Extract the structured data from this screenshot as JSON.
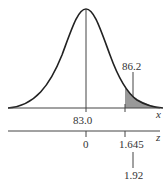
{
  "diagram": {
    "type": "normal-distribution",
    "mean_label": "83.0",
    "cutoff_label": "86.2",
    "x_axis_label": "x",
    "z_axis_label": "z",
    "z_mean_label": "0",
    "z_critical_label": "1.645",
    "z_observed_label": "1.92",
    "shaded_region": "right tail",
    "colors": {
      "curve": "#222222",
      "shade": "#999999",
      "axis": "#444444"
    }
  }
}
